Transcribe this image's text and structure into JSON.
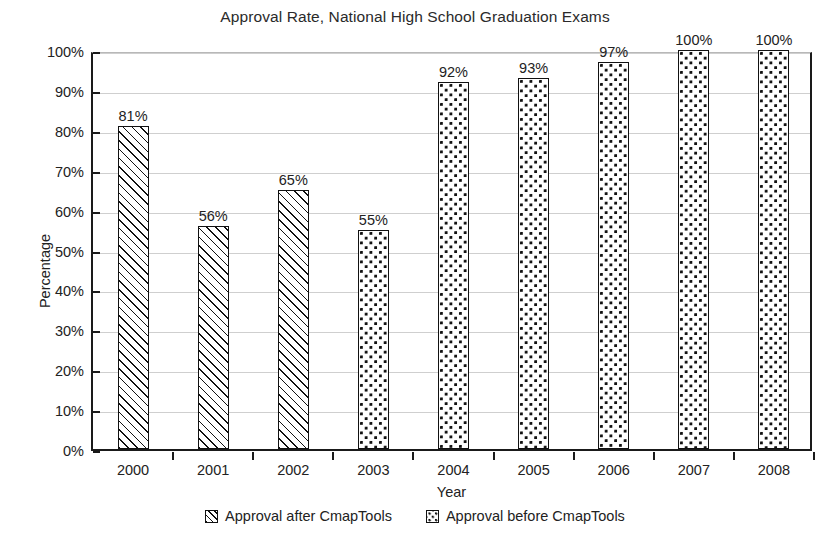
{
  "chart_data": {
    "type": "bar",
    "title": "Approval Rate, National High School Graduation Exams",
    "xlabel": "Year",
    "ylabel": "Percentage",
    "categories": [
      "2000",
      "2001",
      "2002",
      "2003",
      "2004",
      "2005",
      "2006",
      "2007",
      "2008"
    ],
    "values": [
      81,
      56,
      65,
      55,
      92,
      93,
      97,
      100,
      100
    ],
    "value_labels": [
      "81%",
      "56%",
      "65%",
      "55%",
      "92%",
      "93%",
      "97%",
      "100%",
      "100%"
    ],
    "series_of_bar": [
      "after",
      "after",
      "after",
      "before",
      "before",
      "before",
      "before",
      "before",
      "before"
    ],
    "ylim": [
      0,
      100
    ],
    "ytick_values": [
      0,
      10,
      20,
      30,
      40,
      50,
      60,
      70,
      80,
      90,
      100
    ],
    "ytick_labels": [
      "0%",
      "10%",
      "20%",
      "30%",
      "40%",
      "50%",
      "60%",
      "70%",
      "80%",
      "90%",
      "100%"
    ],
    "grid": true,
    "legend_position": "bottom",
    "legend": [
      {
        "key": "after",
        "label": "Approval after CmapTools",
        "pattern": "diagonal-hatch"
      },
      {
        "key": "before",
        "label": "Approval before CmapTools",
        "pattern": "dots"
      }
    ],
    "colors": {
      "ink": "#111111",
      "gridline": "#cfcfcf",
      "background": "#ffffff"
    }
  }
}
